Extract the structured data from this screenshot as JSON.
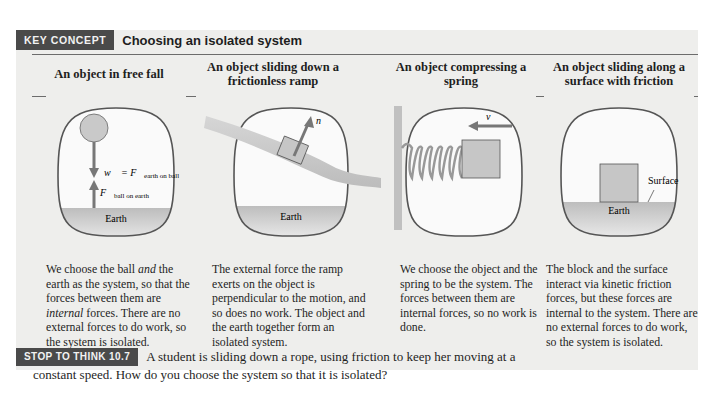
{
  "key_concept": {
    "tag": "KEY CONCEPT",
    "title": "Choosing an isolated system"
  },
  "columns": [
    {
      "heading": "An object in free fall",
      "labels": {
        "weight": "w⃗ = F⃗",
        "weight_sub": "earth on ball",
        "reaction": "F⃗",
        "reaction_sub": "ball on earth",
        "ground": "Earth"
      },
      "description_parts": [
        "We choose the ball ",
        "and",
        " the earth as the system, so that the forces between them are ",
        "internal",
        " forces. There are no external forces to do work, so the system is isolated."
      ]
    },
    {
      "heading": "An object sliding down a frictionless ramp",
      "labels": {
        "normal": "n⃗",
        "ground": "Earth"
      },
      "description": "The external force the ramp exerts on the object is perpendicular to the motion, and so does no work. The object and the earth together form an isolated system."
    },
    {
      "heading": "An object compressing a spring",
      "labels": {
        "velocity": "v⃗"
      },
      "description": "We choose the object and the spring to be the system. The forces between them are internal forces, so no work is done."
    },
    {
      "heading": "An object sliding along a surface with friction",
      "labels": {
        "surface": "Surface",
        "ground": "Earth"
      },
      "description": "The block and the surface interact via kinetic friction forces, but these forces are internal to the system. There are no external forces to do work, so the system is isolated."
    }
  ],
  "stop_to_think": {
    "tag": "STOP TO THINK 10.7",
    "question_line1": "A student is sliding down a rope, using friction to keep her moving at a",
    "question_line2": "constant speed. How do you choose the system so that it is isolated?"
  },
  "colors": {
    "panel_bg": "#eeeeec",
    "tag_bg": "#4a4a4a",
    "arrow": "#7a7a7a",
    "block": "#c4c4c4"
  }
}
